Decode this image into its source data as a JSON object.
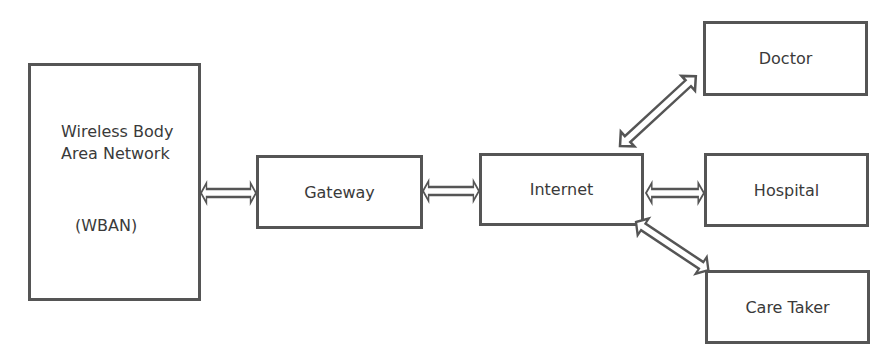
{
  "diagram": {
    "nodes": [
      {
        "id": "wban",
        "line1": "Wireless Body",
        "line2": "Area Network",
        "line3": "(WBAN)"
      },
      {
        "id": "gateway",
        "label": "Gateway"
      },
      {
        "id": "internet",
        "label": "Internet"
      },
      {
        "id": "doctor",
        "label": "Doctor"
      },
      {
        "id": "hospital",
        "label": "Hospital"
      },
      {
        "id": "caretaker",
        "label": "Care Taker"
      }
    ],
    "edges": [
      {
        "from": "wban",
        "to": "gateway",
        "type": "bidirectional"
      },
      {
        "from": "gateway",
        "to": "internet",
        "type": "bidirectional"
      },
      {
        "from": "internet",
        "to": "doctor",
        "type": "bidirectional"
      },
      {
        "from": "internet",
        "to": "hospital",
        "type": "bidirectional"
      },
      {
        "from": "internet",
        "to": "caretaker",
        "type": "bidirectional"
      }
    ],
    "colors": {
      "stroke": "#555555",
      "text": "#3a3a3a",
      "background": "#ffffff"
    }
  }
}
